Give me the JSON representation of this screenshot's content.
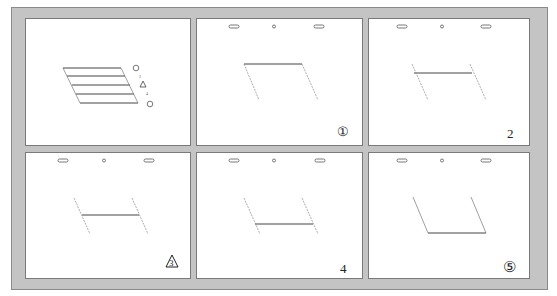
{
  "figure": {
    "panels": [
      {
        "id": "overview",
        "label": "",
        "legend_marks": [
          "⑤",
          "2",
          "△",
          "4",
          "①"
        ]
      },
      {
        "id": "step-1",
        "label": "①"
      },
      {
        "id": "step-2",
        "label": "2"
      },
      {
        "id": "step-3",
        "label": "3"
      },
      {
        "id": "step-4",
        "label": "4"
      },
      {
        "id": "step-5",
        "label": "⑤"
      }
    ]
  },
  "colors": {
    "frame": "#c4c4c4",
    "panel_border": "#7a7a7a",
    "line": "#444444",
    "guide": "#888888"
  }
}
